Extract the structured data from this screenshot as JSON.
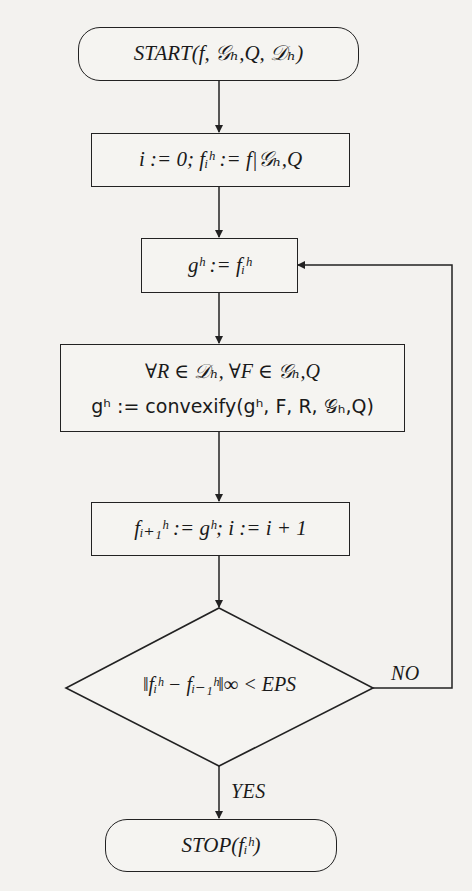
{
  "diagram": {
    "type": "flowchart",
    "nodes": {
      "start": {
        "shape": "terminal",
        "text": "START(f, 𝒢ₕ,Q, 𝒟ₕ)"
      },
      "init": {
        "shape": "process",
        "text": "i := 0; fᵢʰ := f|𝒢ₕ,Q"
      },
      "assign_g": {
        "shape": "process",
        "text": "gʰ := fᵢʰ"
      },
      "convexify": {
        "shape": "process",
        "line1": "∀R ∈ 𝒟ₕ, ∀F ∈ 𝒢ₕ,Q",
        "line2": "gʰ := convexify(gʰ, F, R, 𝒢ₕ,Q)"
      },
      "update": {
        "shape": "process",
        "text": "fᵢ₊₁ʰ := gʰ; i := i + 1"
      },
      "check": {
        "shape": "decision",
        "text": "‖fᵢʰ − fᵢ₋₁ʰ‖∞ < EPS"
      },
      "stop": {
        "shape": "terminal",
        "text": "STOP(fᵢʰ)"
      }
    },
    "edge_labels": {
      "no": "NO",
      "yes": "YES"
    },
    "edges": [
      {
        "from": "start",
        "to": "init"
      },
      {
        "from": "init",
        "to": "assign_g"
      },
      {
        "from": "assign_g",
        "to": "convexify"
      },
      {
        "from": "convexify",
        "to": "update"
      },
      {
        "from": "update",
        "to": "check"
      },
      {
        "from": "check",
        "to": "assign_g",
        "label": "NO"
      },
      {
        "from": "check",
        "to": "stop",
        "label": "YES"
      }
    ]
  }
}
